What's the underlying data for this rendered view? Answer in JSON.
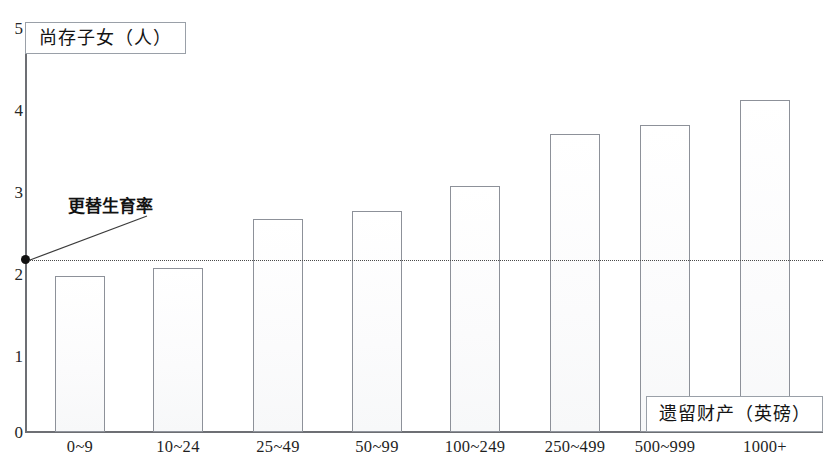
{
  "chart_data": {
    "type": "bar",
    "title": "",
    "xlabel": "遗留财产（英磅）",
    "ylabel": "尚存子女（人）",
    "categories": [
      "0~9",
      "10~24",
      "25~49",
      "50~99",
      "100~249",
      "250~499",
      "500~999",
      "1000+"
    ],
    "values": [
      1.9,
      2.0,
      2.6,
      2.7,
      3.0,
      3.63,
      3.74,
      4.05
    ],
    "ylim": [
      0,
      5
    ],
    "ytick_labels": [
      "0",
      "1",
      "2",
      "3",
      "4",
      "5"
    ],
    "ytick_values": [
      0,
      1,
      2,
      3,
      4,
      5
    ],
    "grid": false,
    "legend": "none",
    "annotations": [
      {
        "text": "更替生育率",
        "value": 2.1,
        "style": "dotted-horizontal-line-with-leader-and-dot"
      }
    ]
  },
  "colors": {
    "bar_fill": "#fdfdfd",
    "bar_border": "#8d9199",
    "axis": "#6d6f74",
    "text": "#1a1a1a",
    "annotation_line": "#4a4a4a",
    "box_border": "#9aa0a8"
  }
}
